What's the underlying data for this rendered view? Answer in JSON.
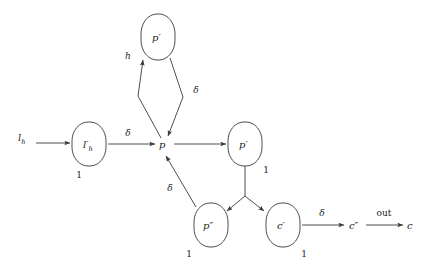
{
  "diagram": {
    "background_color": "#ffffff",
    "stroke_color": "#3a3a3a",
    "text_color": "#1a1a1a",
    "nodes": [
      {
        "id": "lh_source",
        "label": "l",
        "sub": "h",
        "prime": "",
        "shape": "none",
        "weight": "",
        "x": 22,
        "y": 137
      },
      {
        "id": "lh_prime",
        "label": "l",
        "sub": "h",
        "prime": "′",
        "shape": "squircle",
        "weight": "1",
        "x": 89,
        "y": 144
      },
      {
        "id": "p",
        "label": "p",
        "sub": "",
        "prime": "",
        "shape": "none",
        "weight": "",
        "x": 163,
        "y": 145
      },
      {
        "id": "p_prime_top",
        "label": "p",
        "sub": "",
        "prime": "′",
        "shape": "squircle",
        "weight": "",
        "x": 158,
        "y": 38
      },
      {
        "id": "p_prime_right",
        "label": "p",
        "sub": "",
        "prime": "′",
        "shape": "squircle",
        "weight": "1",
        "x": 245,
        "y": 144
      },
      {
        "id": "p_double_prime",
        "label": "p",
        "sub": "",
        "prime": "″",
        "shape": "squircle",
        "weight": "1",
        "x": 211,
        "y": 225
      },
      {
        "id": "c_prime",
        "label": "c",
        "sub": "",
        "prime": "′",
        "shape": "squircle",
        "weight": "1",
        "x": 283,
        "y": 225
      },
      {
        "id": "c_double_prime",
        "label": "c",
        "sub": "",
        "prime": "″",
        "shape": "none",
        "weight": "",
        "x": 355,
        "y": 226
      },
      {
        "id": "c_sink",
        "label": "c",
        "sub": "",
        "prime": "",
        "shape": "none",
        "weight": "",
        "x": 411,
        "y": 226
      }
    ],
    "edges": [
      {
        "id": "edge-lh-to-lhprime",
        "from": "lh_source",
        "to": "lh_prime",
        "label": ""
      },
      {
        "id": "edge-lhprime-to-p",
        "from": "lh_prime",
        "to": "p",
        "label": "δ"
      },
      {
        "id": "edge-p-to-pprimetop",
        "from": "p",
        "to": "p_prime_top",
        "label": "h"
      },
      {
        "id": "edge-pprimetop-to-p",
        "from": "p_prime_top",
        "to": "p",
        "label": "δ"
      },
      {
        "id": "edge-p-to-pprimeright",
        "from": "p",
        "to": "p_prime_right",
        "label": ""
      },
      {
        "id": "edge-pprimeright-fork-to-pdoubleprime",
        "from": "p_prime_right",
        "to": "p_double_prime",
        "label": ""
      },
      {
        "id": "edge-pprimeright-fork-to-cprime",
        "from": "p_prime_right",
        "to": "c_prime",
        "label": ""
      },
      {
        "id": "edge-pdoubleprime-to-p",
        "from": "p_double_prime",
        "to": "p",
        "label": "δ"
      },
      {
        "id": "edge-cprime-to-cdoubleprime",
        "from": "c_prime",
        "to": "c_double_prime",
        "label": "δ"
      },
      {
        "id": "edge-cdoubleprime-to-c",
        "from": "c_double_prime",
        "to": "c_sink",
        "label": "out"
      }
    ],
    "edge_labels": {
      "delta_lhprime_p": "δ",
      "h_to_pprime": "h",
      "delta_pprime_p": "δ",
      "delta_pdoubleprime_p": "δ",
      "delta_cprime_cdoubleprime": "δ",
      "out_cdoubleprime_c": "out"
    },
    "weights": {
      "lh_prime": "1",
      "p_prime_right": "1",
      "p_double_prime": "1",
      "c_prime": "1"
    },
    "node_text": {
      "lh_source_main": "l",
      "lh_source_sub": "h",
      "lh_prime_main": "l",
      "lh_prime_sub": "h",
      "lh_prime_mark": "′",
      "p_main": "p",
      "p_prime_top_main": "p",
      "p_prime_top_mark": "′",
      "p_prime_right_main": "p",
      "p_prime_right_mark": "′",
      "p_double_prime_main": "p",
      "p_double_prime_mark": "″",
      "c_prime_main": "c",
      "c_prime_mark": "′",
      "c_double_prime_main": "c",
      "c_double_prime_mark": "″",
      "c_sink_main": "c"
    }
  }
}
